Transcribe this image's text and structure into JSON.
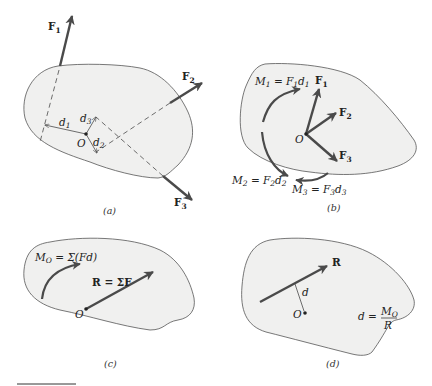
{
  "figure": {
    "panels": [
      {
        "id": "a",
        "caption": "(a)",
        "labels": {
          "F1": "F",
          "F1_sub": "1",
          "F2": "F",
          "F2_sub": "2",
          "F3": "F",
          "F3_sub": "3",
          "d1": "d",
          "d1_sub": "1",
          "d2": "d",
          "d2_sub": "2",
          "d3": "d",
          "d3_sub": "3",
          "O": "O"
        }
      },
      {
        "id": "b",
        "caption": "(b)",
        "labels": {
          "F1": "F",
          "F1_sub": "1",
          "F2": "F",
          "F2_sub": "2",
          "F3": "F",
          "F3_sub": "3",
          "O": "O",
          "M1_lhs": "M",
          "M1_lhs_sub": "1",
          "M1_eq": " = F",
          "M1_f_sub": "1",
          "M1_d": "d",
          "M1_d_sub": "1",
          "M2_lhs": "M",
          "M2_lhs_sub": "2",
          "M2_eq": " = F",
          "M2_f_sub": "2",
          "M2_d": "d",
          "M2_d_sub": "2",
          "M3_lhs": "M",
          "M3_lhs_sub": "3",
          "M3_eq": " = F",
          "M3_f_sub": "3",
          "M3_d": "d",
          "M3_d_sub": "3"
        }
      },
      {
        "id": "c",
        "caption": "(c)",
        "labels": {
          "MO": "M",
          "MO_sub": "O",
          "MO_rhs": " = Σ(Fd)",
          "R": "R",
          "R_rhs": " = ΣF",
          "O": "O"
        }
      },
      {
        "id": "d",
        "caption": "(d)",
        "labels": {
          "R": "R",
          "d": "d",
          "O": "O",
          "eq_lhs": "d =",
          "eq_num": "M",
          "eq_num_sub": "O",
          "eq_den": "R"
        }
      }
    ]
  }
}
